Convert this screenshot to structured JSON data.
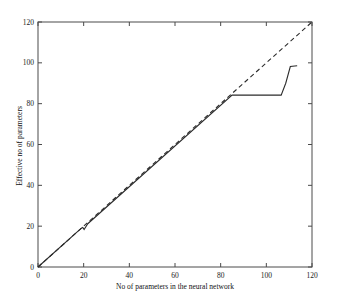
{
  "chart_data": {
    "type": "line",
    "title": "",
    "xlabel": "No of parameters in the neural network",
    "ylabel": "Effective no of parameters",
    "xlim": [
      0,
      120
    ],
    "ylim": [
      0,
      120
    ],
    "xticks": [
      0,
      20,
      40,
      60,
      80,
      100,
      120
    ],
    "yticks": [
      0,
      20,
      40,
      60,
      80,
      100,
      120
    ],
    "xtick_labels": [
      "0",
      "20",
      "40",
      "60",
      "80",
      "100",
      "120"
    ],
    "ytick_labels": [
      "0",
      "20",
      "40",
      "60",
      "80",
      "100",
      "120"
    ],
    "grid": false,
    "legend": "none",
    "series": [
      {
        "name": "Effective no of parameters",
        "style": "solid",
        "color": "#2b2b2b",
        "x": [
          0,
          19,
          19.6,
          20.2,
          21.8,
          85,
          106.5,
          108.5,
          110.5,
          113.5
        ],
        "y": [
          0,
          19,
          19.4,
          18.4,
          21.2,
          84.2,
          84.2,
          90,
          98.2,
          98.6
        ]
      },
      {
        "name": "Identity reference (y = x)",
        "style": "dashed",
        "color": "#2b2b2b",
        "x": [
          0,
          120
        ],
        "y": [
          0,
          120
        ]
      }
    ]
  },
  "axes": {
    "x_title": "No of parameters in the neural network",
    "y_title": "Effective no of parameters"
  }
}
